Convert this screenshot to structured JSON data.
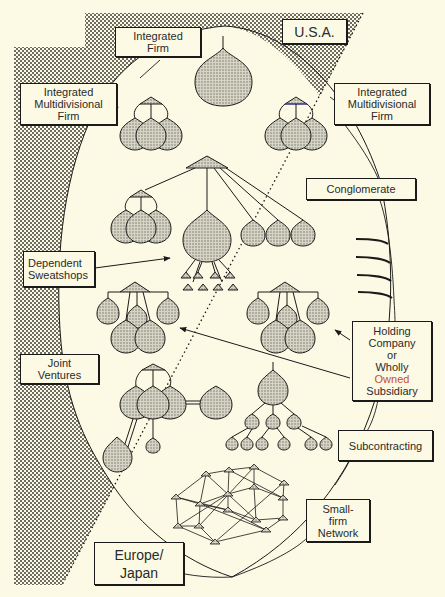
{
  "diagram": {
    "regions": {
      "usa": "U.S.A.",
      "europe_japan": "Europe/\nJapan"
    },
    "labels": {
      "integrated_firm": "Integrated\nFirm",
      "integrated_multidivisional_left": "Integrated\nMultidivisional\nFirm",
      "integrated_multidivisional_right": "Integrated\nMultidivisional\nFirm",
      "conglomerate": "Conglomerate",
      "dependent_sweatshops": "Dependent\nSweatshops",
      "holding_company_line1": "Holding\nCompany\nor\nWholly",
      "holding_company_owned": "Owned",
      "holding_company_line3": "Subsidiary",
      "joint_ventures": "Joint\nVentures",
      "subcontracting": "Subcontracting",
      "small_firm_network": "Small-\nfirm\nNetwork"
    },
    "colors": {
      "background": "#fcfae4",
      "stipple": "#4a4a44",
      "ink": "#1a1a1a",
      "owned_accent": "#c8502a"
    }
  }
}
